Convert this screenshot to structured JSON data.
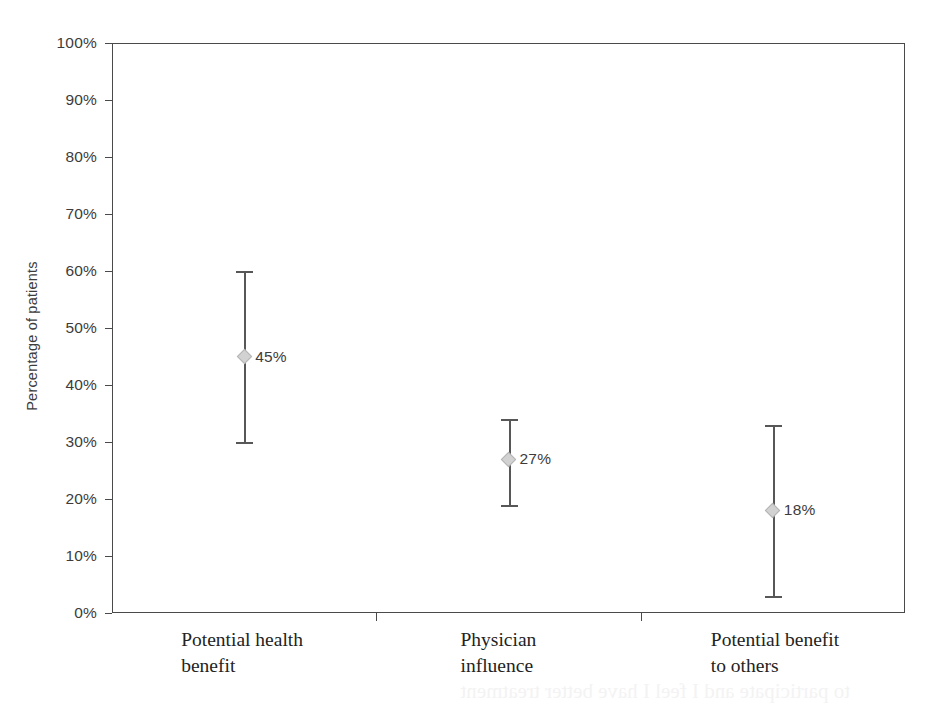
{
  "chart_data": {
    "type": "scatter",
    "title": "",
    "subtitle": "",
    "xlabel": "",
    "ylabel": "Percentage of patients",
    "ylim": [
      0,
      100
    ],
    "y_unit": "%",
    "grid": false,
    "legend": null,
    "categories": [
      "Potential health\nbenefit",
      "Physician\ninfluence",
      "Potential benefit\nto others"
    ],
    "values": [
      45,
      27,
      18
    ],
    "value_labels": [
      "45%",
      "27%",
      "18%"
    ],
    "error_low": [
      30,
      19,
      3
    ],
    "error_high": [
      60,
      34,
      33
    ],
    "series": [
      {
        "name": "Percentage of patients",
        "points": [
          {
            "category": "Potential health benefit",
            "value": 45,
            "label": "45%",
            "ci_low": 30,
            "ci_high": 60
          },
          {
            "category": "Physician influence",
            "value": 27,
            "label": "27%",
            "ci_low": 19,
            "ci_high": 34
          },
          {
            "category": "Potential benefit to others",
            "value": 18,
            "label": "18%",
            "ci_low": 3,
            "ci_high": 33
          }
        ]
      }
    ],
    "y_ticks": [
      0,
      10,
      20,
      30,
      40,
      50,
      60,
      70,
      80,
      90,
      100
    ],
    "y_tick_labels": [
      "0%",
      "10%",
      "20%",
      "30%",
      "40%",
      "50%",
      "60%",
      "70%",
      "80%",
      "90%",
      "100%"
    ],
    "colors": {
      "marker_fill": "#d2d2d2",
      "marker_edge": "#b4b4b4",
      "errorbar": "#575757",
      "axis": "#4a4a4a",
      "text": "#3c3c3c",
      "category_text": "#232323",
      "background": "#ffffff"
    }
  },
  "axis": {
    "y_title": "Percentage of patients"
  },
  "artifact": {
    "ghost_text": "to participate and I feel I have better treatment"
  }
}
